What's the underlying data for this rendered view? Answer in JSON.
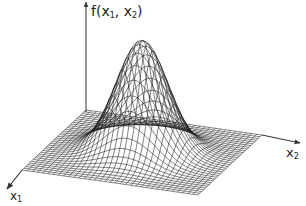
{
  "chart_data": {
    "type": "surface-wireframe",
    "title": "",
    "function": "f(x1, x2) = exp(-(x1^2 + x2^2) / (2*sigma^2))",
    "axes": {
      "vertical": {
        "label": "f(x₁, x₂)",
        "label_main": "f(x",
        "sub1": "1",
        "mid": ", x",
        "sub2": "2",
        "close": ")"
      },
      "x2": {
        "label": "x₂",
        "main": "x",
        "sub": "2"
      },
      "x1": {
        "label": "x₁",
        "main": "x",
        "sub": "1"
      }
    },
    "grid": {
      "lines_per_side": 34,
      "domain": [
        -3,
        3
      ],
      "sigma": 0.85,
      "peak_height": 1.0
    },
    "ticks": "none",
    "legend": "none"
  },
  "render": {
    "line_color": "#1a1a1a",
    "axis_color": "#333333",
    "origin": [
      86,
      110
    ],
    "x1_dir": [
      -64,
      60
    ],
    "x2_dir": [
      176,
      25
    ],
    "height_px": 112,
    "f_axis": {
      "x": 86,
      "y_top": 2,
      "y_bottom": 112
    },
    "x2_axis": {
      "from": [
        262,
        135
      ],
      "to": [
        300,
        143
      ]
    },
    "x1_axis": {
      "from": [
        22,
        170
      ],
      "to": [
        7,
        189
      ]
    }
  }
}
